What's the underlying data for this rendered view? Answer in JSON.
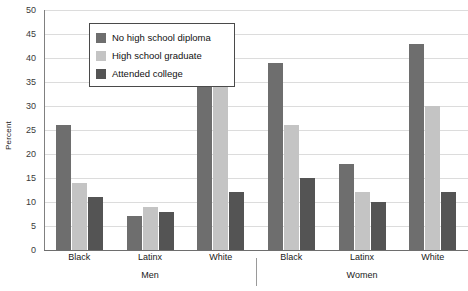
{
  "chart_data": {
    "type": "bar",
    "title": "",
    "subtitle": "",
    "xlabel": "",
    "ylabel": "Percent",
    "ylim": [
      0,
      50
    ],
    "ytick_step": 5,
    "yticks": [
      0,
      5,
      10,
      15,
      20,
      25,
      30,
      35,
      40,
      45,
      50
    ],
    "grid": true,
    "legend_position": "top-left",
    "supergroups": [
      "Men",
      "Women"
    ],
    "categories": [
      "Black",
      "Latinx",
      "White",
      "Black",
      "Latinx",
      "White"
    ],
    "category_supergroup": [
      "Men",
      "Men",
      "Men",
      "Women",
      "Women",
      "Women"
    ],
    "series": [
      {
        "name": "No high school diploma",
        "color": "#6e6e6e",
        "values": [
          26,
          7,
          43,
          39,
          18,
          43
        ]
      },
      {
        "name": "High school graduate",
        "color": "#c4c4c4",
        "values": [
          14,
          9,
          37,
          26,
          12,
          30
        ]
      },
      {
        "name": "Attended college",
        "color": "#545454",
        "values": [
          11,
          8,
          12,
          15,
          10,
          12
        ]
      }
    ]
  },
  "axis": {
    "y_title": "Percent"
  },
  "legend": {
    "items": [
      {
        "label": "No high school diploma",
        "color": "#6e6e6e"
      },
      {
        "label": "High school graduate",
        "color": "#c4c4c4"
      },
      {
        "label": "Attended college",
        "color": "#545454"
      }
    ]
  },
  "colors": {
    "background": "#ffffff",
    "gridline": "#dcdcdc",
    "axis": "#6e6e6e",
    "text": "#1a1a1a",
    "legend_border": "#4a4a4a"
  }
}
